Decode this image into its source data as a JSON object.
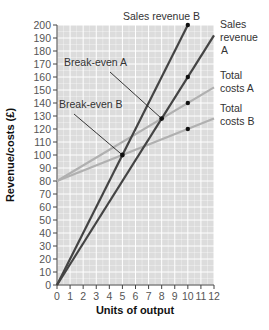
{
  "chart_data": {
    "type": "line",
    "title": "",
    "xlabel": "Units of output",
    "ylabel": "Revenue/costs (£)",
    "xlim": [
      0,
      12
    ],
    "ylim": [
      0,
      200
    ],
    "grid": true,
    "x_ticks": [
      0,
      1,
      2,
      3,
      4,
      5,
      6,
      7,
      8,
      9,
      10,
      11,
      12
    ],
    "y_ticks": [
      0,
      10,
      20,
      30,
      40,
      50,
      60,
      70,
      80,
      90,
      100,
      110,
      120,
      130,
      140,
      150,
      160,
      170,
      180,
      190,
      200
    ],
    "series": [
      {
        "name": "Sales revenue B",
        "x": [
          0,
          10
        ],
        "y": [
          0,
          200
        ],
        "color": "#444444",
        "marker_at": [
          10,
          200
        ]
      },
      {
        "name": "Sales revenue A",
        "x": [
          0,
          12
        ],
        "y": [
          0,
          192
        ],
        "color": "#444444",
        "marker_at": [
          10,
          160
        ]
      },
      {
        "name": "Total costs A",
        "x": [
          0,
          12
        ],
        "y": [
          80,
          152
        ],
        "color": "#b0b0b0",
        "marker_at": [
          10,
          140
        ]
      },
      {
        "name": "Total costs B",
        "x": [
          0,
          12
        ],
        "y": [
          80,
          128
        ],
        "color": "#b0b0b0",
        "marker_at": [
          10,
          120
        ]
      }
    ],
    "annotations": [
      {
        "text": "Break-even A",
        "x": 8,
        "y": 128
      },
      {
        "text": "Break-even B",
        "x": 5,
        "y": 100
      }
    ],
    "legend_position": "right (inline labels)"
  },
  "labels": {
    "sales_revenue_b": "Sales revenue B",
    "sales_revenue_a_1": "Sales",
    "sales_revenue_a_2": "revenue",
    "sales_revenue_a_3": "A",
    "total_costs_a_1": "Total",
    "total_costs_a_2": "costs A",
    "total_costs_b_1": "Total",
    "total_costs_b_2": "costs B",
    "break_even_a": "Break-even A",
    "break_even_b": "Break-even B",
    "xlabel": "Units of output",
    "ylabel": "Revenue/costs (£)"
  },
  "colors": {
    "plot_bg": "#dcdcdc",
    "grid": "#ffffff",
    "revenue_line": "#444444",
    "cost_line": "#b0b0b0",
    "axis": "#444444"
  }
}
